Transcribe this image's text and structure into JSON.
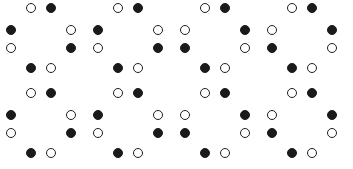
{
  "figure": {
    "title": "",
    "background_color": "#ffffff",
    "width": 353,
    "height": 169,
    "grid": {
      "rows": 2,
      "columns": 4,
      "total_clusters": 8
    },
    "node_styles": {
      "filled": {
        "name": "filled-circle",
        "fill_color": "#1a1a1a",
        "stroke_color": "#1a1a1a"
      },
      "open": {
        "name": "open-circle",
        "fill_color": "#ffffff",
        "stroke_color": "#1f1f1f"
      }
    },
    "node_diameter": 10,
    "ring_positions": [
      "top-left",
      "top-right",
      "left-upper",
      "right-upper",
      "left-lower",
      "right-lower",
      "bottom-left",
      "bottom-right"
    ],
    "patterns": {
      "A": {
        "name": "pattern-a",
        "nodes": [
          "open",
          "filled",
          "filled",
          "open",
          "open",
          "filled",
          "filled",
          "open"
        ]
      },
      "B": {
        "name": "pattern-b-mirrored",
        "nodes": [
          "open",
          "filled",
          "open",
          "filled",
          "filled",
          "open",
          "filled",
          "open"
        ]
      }
    },
    "clusters": [
      {
        "id": "cluster-r1c1",
        "row": 1,
        "column": 1,
        "pattern": "A",
        "x": 4,
        "y": 3
      },
      {
        "id": "cluster-r1c2",
        "row": 1,
        "column": 2,
        "pattern": "A",
        "x": 91,
        "y": 3
      },
      {
        "id": "cluster-r1c3",
        "row": 1,
        "column": 3,
        "pattern": "B",
        "x": 178,
        "y": 3
      },
      {
        "id": "cluster-r1c4",
        "row": 1,
        "column": 4,
        "pattern": "B",
        "x": 265,
        "y": 3
      },
      {
        "id": "cluster-r2c1",
        "row": 2,
        "column": 1,
        "pattern": "A",
        "x": 4,
        "y": 88
      },
      {
        "id": "cluster-r2c2",
        "row": 2,
        "column": 2,
        "pattern": "A",
        "x": 91,
        "y": 88
      },
      {
        "id": "cluster-r2c3",
        "row": 2,
        "column": 3,
        "pattern": "B",
        "x": 178,
        "y": 88
      },
      {
        "id": "cluster-r2c4",
        "row": 2,
        "column": 4,
        "pattern": "B",
        "x": 265,
        "y": 88
      }
    ],
    "node_offsets": [
      {
        "position": "top-left",
        "x": 22,
        "y": 0
      },
      {
        "position": "top-right",
        "x": 42,
        "y": 0
      },
      {
        "position": "left-upper",
        "x": 2,
        "y": 22
      },
      {
        "position": "right-upper",
        "x": 62,
        "y": 22
      },
      {
        "position": "left-lower",
        "x": 2,
        "y": 40
      },
      {
        "position": "right-lower",
        "x": 62,
        "y": 40
      },
      {
        "position": "bottom-left",
        "x": 22,
        "y": 60
      },
      {
        "position": "bottom-right",
        "x": 42,
        "y": 60
      }
    ]
  }
}
